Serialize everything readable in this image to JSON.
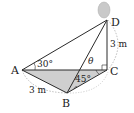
{
  "diagram": {
    "type": "3d-geometry",
    "points": {
      "A": {
        "label": "A"
      },
      "B": {
        "label": "B"
      },
      "C": {
        "label": "C"
      },
      "D": {
        "label": "D"
      }
    },
    "labels": {
      "DC_length": "3 m",
      "AB_length": "3 m",
      "angle_DAC": "30°",
      "angle_BCA": "45°",
      "theta": "θ"
    },
    "colors": {
      "line": "#2a2a2a",
      "fill": "#c8c8c8",
      "balloon": "#c9c9c9",
      "dashed": "#9a9a9a"
    }
  }
}
